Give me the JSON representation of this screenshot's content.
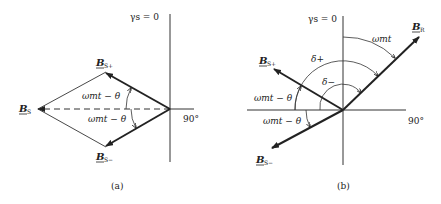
{
  "figure_a": {
    "caption": "(a)",
    "axis_top_label": "γs = 0",
    "axis_right_label": "90°",
    "vectors": {
      "bs_plus": {
        "main": "B",
        "sub": "S+"
      },
      "bs_minus": {
        "main": "B",
        "sub": "S−"
      },
      "bs": {
        "main": "B",
        "sub": "S"
      }
    },
    "angle_upper": "ωmt − θ",
    "angle_lower": "ωmt − θ"
  },
  "figure_b": {
    "caption": "(b)",
    "axis_top_label": "γs = 0",
    "axis_right_label": "90°",
    "vectors": {
      "br": {
        "main": "B",
        "sub": "R"
      },
      "bs_plus": {
        "main": "B",
        "sub": "S+"
      },
      "bs_minus": {
        "main": "B",
        "sub": "S−"
      }
    },
    "angle_wmt": "ωmt",
    "angle_delta_plus": "δ+",
    "angle_delta_minus": "δ−",
    "angle_upper": "ωmt − θ",
    "angle_lower": "ωmt − θ"
  }
}
